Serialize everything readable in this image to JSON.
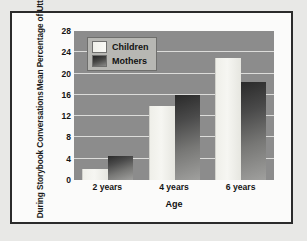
{
  "chart_data": {
    "type": "bar",
    "title": "",
    "xlabel": "Age",
    "ylabel_line1": "Mean Percentage of Utterances",
    "ylabel_line2": "During Storybook Conversations",
    "categories": [
      "2 years",
      "4 years",
      "6 years"
    ],
    "series": [
      {
        "name": "Children",
        "values": [
          2,
          14,
          23
        ],
        "color": "#f2f2ec"
      },
      {
        "name": "Mothers",
        "values": [
          4.5,
          16,
          18.5
        ],
        "color": "#3a3a3a"
      }
    ],
    "ylim": [
      0,
      28
    ],
    "yticks": [
      0,
      4,
      8,
      12,
      16,
      20,
      24,
      28
    ],
    "grid": true,
    "legend_position": "top-left",
    "plot_background": "#8c8c8c",
    "gridline_color": "#dcdcda",
    "frame_border_color": "#2b2b2b",
    "page_background": "#e8e8e6"
  }
}
